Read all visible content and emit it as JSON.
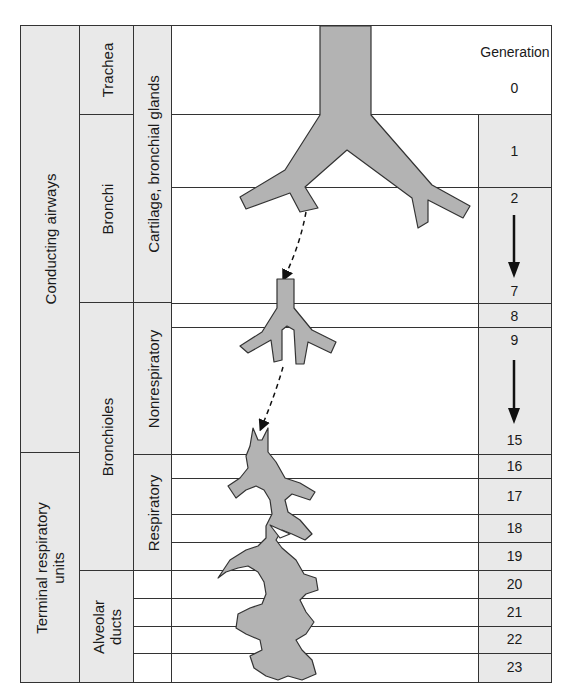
{
  "diagram": {
    "type": "airway branching schematic",
    "columns": {
      "zone": [
        {
          "label": "Conducting airways"
        },
        {
          "label": "Terminal respiratory units"
        }
      ],
      "structure": [
        {
          "label": "Trachea"
        },
        {
          "label": "Bronchi"
        },
        {
          "label": "Bronchioles"
        },
        {
          "label": "Alveolar ducts"
        }
      ],
      "feature": [
        {
          "label": "Cartilage, bronchial glands"
        },
        {
          "label": "Nonrespiratory"
        },
        {
          "label": "Respiratory"
        }
      ]
    },
    "generation": {
      "header": "Generation",
      "values": [
        "0",
        "1",
        "2",
        "7",
        "8",
        "9",
        "15",
        "16",
        "17",
        "18",
        "19",
        "20",
        "21",
        "22",
        "23"
      ]
    },
    "colors": {
      "airway_fill": "#b3b3b3",
      "label_shade": "#e9e9e9",
      "line": "#333333"
    }
  }
}
